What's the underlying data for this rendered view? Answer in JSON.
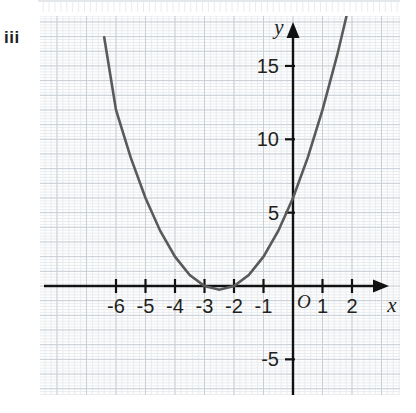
{
  "part_label": "iii",
  "colors": {
    "curve": "#5a5a5a",
    "axis": "#111111",
    "grid_minor": "#e9ecef",
    "grid_major": "#c9cfd6",
    "text": "#231f20",
    "background": "#ffffff"
  },
  "axes": {
    "x_name": "x",
    "y_name": "y",
    "origin_label": "O",
    "x_ticks": [
      "-6",
      "-5",
      "-4",
      "-3",
      "-2",
      "-1",
      "1",
      "2"
    ],
    "y_ticks": [
      "15",
      "10",
      "5",
      "-5"
    ]
  },
  "chart_data": {
    "type": "line",
    "title": "",
    "subtitle": "",
    "xlabel": "x",
    "ylabel": "y",
    "legend": [],
    "legend_position": "none",
    "grid": true,
    "grid_minor_step": 0.2,
    "grid_major_step": 1,
    "xlim": [
      -7.5,
      3.6
    ],
    "ylim": [
      -7.2,
      17.5
    ],
    "xticks": [
      -6,
      -5,
      -4,
      -3,
      -2,
      -1,
      1,
      2
    ],
    "yticks": [
      15,
      10,
      5,
      -5
    ],
    "series": [
      {
        "name": "y = x^2 + 5x + 6",
        "type": "parabola",
        "vertex": [
          -2.5,
          -0.25
        ],
        "roots": [
          -3,
          -2
        ],
        "y_intercept": 6,
        "x_domain": [
          -6.4,
          1.95
        ],
        "x": [
          -6.4,
          -6.0,
          -5.5,
          -5.0,
          -4.5,
          -4.0,
          -3.5,
          -3.0,
          -2.5,
          -2.0,
          -1.5,
          -1.0,
          -0.5,
          0.0,
          0.5,
          1.0,
          1.5,
          1.95
        ],
        "y": [
          16.96,
          12.0,
          8.75,
          6.0,
          3.75,
          2.0,
          0.75,
          0.0,
          -0.25,
          0.0,
          0.75,
          2.0,
          3.75,
          6.0,
          8.75,
          12.0,
          15.75,
          19.55
        ]
      }
    ],
    "annotations": []
  }
}
